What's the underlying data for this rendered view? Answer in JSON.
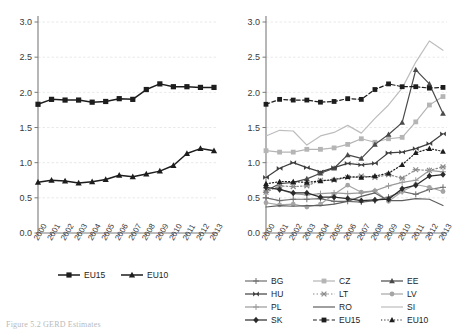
{
  "figure": {
    "caption": "Figure 5.2  GERD Estimates",
    "panels": [
      "left",
      "right"
    ]
  },
  "colors": {
    "dark": "#1d1d1d",
    "mid_dark": "#555555",
    "mid": "#7a7a7a",
    "light_mid": "#9e9e9e",
    "light": "#b5b5b5",
    "lighter": "#c8c8c8",
    "grid": "#e3e3e3",
    "axis": "#7b7b7b",
    "text": "#3a3a3a"
  },
  "chart_data": [
    {
      "panel": "left",
      "type": "line",
      "title": "",
      "xlabel": "",
      "ylabel": "",
      "grid": true,
      "legend_position": "bottom",
      "x": [
        "2000",
        "2001",
        "2002",
        "2003",
        "2004",
        "2005",
        "2006",
        "2007",
        "2008",
        "2009",
        "2010",
        "2011",
        "2012",
        "2013"
      ],
      "xlim": [
        2000,
        2013
      ],
      "ylim": [
        0.0,
        3.0
      ],
      "yticks": [
        "0.0",
        "0.5",
        "1.0",
        "1.5",
        "2.0",
        "2.5",
        "3.0"
      ],
      "series": [
        {
          "name": "EU15",
          "marker": "square",
          "dash": "solid",
          "color": "#1d1d1d",
          "values": [
            1.83,
            1.9,
            1.89,
            1.89,
            1.86,
            1.87,
            1.91,
            1.9,
            2.04,
            2.12,
            2.08,
            2.08,
            2.07,
            2.07
          ]
        },
        {
          "name": "EU10",
          "marker": "triangle",
          "dash": "solid",
          "color": "#1d1d1d",
          "values": [
            0.72,
            0.75,
            0.74,
            0.71,
            0.73,
            0.76,
            0.82,
            0.8,
            0.84,
            0.88,
            0.96,
            1.13,
            1.2,
            1.17
          ]
        }
      ]
    },
    {
      "panel": "right",
      "type": "line",
      "title": "",
      "xlabel": "",
      "ylabel": "",
      "grid": true,
      "legend_position": "bottom",
      "x": [
        "2000",
        "2001",
        "2002",
        "2003",
        "2004",
        "2005",
        "2006",
        "2007",
        "2008",
        "2009",
        "2010",
        "2011",
        "2012",
        "2013"
      ],
      "xlim": [
        2000,
        2013
      ],
      "ylim": [
        0.0,
        3.0
      ],
      "yticks": [
        "0.0",
        "0.5",
        "1.0",
        "1.5",
        "2.0",
        "2.5",
        "3.0"
      ],
      "series": [
        {
          "name": "BG",
          "marker": "plus",
          "dash": "solid",
          "color": "#6e6e6e",
          "values": [
            0.5,
            0.46,
            0.48,
            0.48,
            0.49,
            0.45,
            0.45,
            0.44,
            0.46,
            0.51,
            0.59,
            0.55,
            0.62,
            0.65
          ]
        },
        {
          "name": "CZ",
          "marker": "square",
          "dash": "solid",
          "color": "#b5b5b5",
          "values": [
            1.17,
            1.15,
            1.15,
            1.19,
            1.19,
            1.21,
            1.26,
            1.34,
            1.29,
            1.34,
            1.36,
            1.58,
            1.82,
            1.94
          ]
        },
        {
          "name": "EE",
          "marker": "triangle",
          "dash": "solid",
          "color": "#4a4a4a",
          "values": [
            0.6,
            0.7,
            0.72,
            0.77,
            0.85,
            0.92,
            1.11,
            1.06,
            1.26,
            1.4,
            1.57,
            2.32,
            2.12,
            1.7
          ]
        },
        {
          "name": "HU",
          "marker": "bowtie",
          "dash": "solid",
          "color": "#3f3f3f",
          "values": [
            0.79,
            0.92,
            1.0,
            0.93,
            0.87,
            0.93,
            0.99,
            0.97,
            0.99,
            1.14,
            1.15,
            1.2,
            1.27,
            1.41
          ]
        },
        {
          "name": "LT",
          "marker": "asterisk",
          "dash": "dot",
          "color": "#8a8a8a",
          "values": [
            0.58,
            0.67,
            0.66,
            0.67,
            0.75,
            0.75,
            0.79,
            0.81,
            0.79,
            0.83,
            0.78,
            0.9,
            0.89,
            0.94
          ]
        },
        {
          "name": "LV",
          "marker": "circle",
          "dash": "solid",
          "color": "#a5a5a5",
          "values": [
            0.43,
            0.4,
            0.41,
            0.37,
            0.41,
            0.55,
            0.68,
            0.58,
            0.6,
            0.45,
            0.59,
            0.69,
            0.65,
            0.59
          ]
        },
        {
          "name": "PL",
          "marker": "plus",
          "dash": "solid",
          "color": "#9a9a9a",
          "values": [
            0.64,
            0.62,
            0.56,
            0.54,
            0.56,
            0.57,
            0.56,
            0.57,
            0.6,
            0.67,
            0.72,
            0.75,
            0.89,
            0.87
          ]
        },
        {
          "name": "RO",
          "marker": "none",
          "dash": "solid",
          "color": "#5f5f5f",
          "values": [
            0.37,
            0.39,
            0.38,
            0.39,
            0.39,
            0.41,
            0.45,
            0.52,
            0.57,
            0.46,
            0.46,
            0.49,
            0.48,
            0.39
          ]
        },
        {
          "name": "SI",
          "marker": "none",
          "dash": "solid",
          "color": "#bdbdbd",
          "values": [
            1.38,
            1.46,
            1.45,
            1.25,
            1.38,
            1.43,
            1.53,
            1.42,
            1.63,
            1.82,
            2.06,
            2.43,
            2.73,
            2.6
          ]
        },
        {
          "name": "SK",
          "marker": "diamond",
          "dash": "solid",
          "color": "#2b2b2b",
          "values": [
            0.65,
            0.62,
            0.57,
            0.57,
            0.51,
            0.51,
            0.49,
            0.46,
            0.47,
            0.48,
            0.63,
            0.68,
            0.81,
            0.83
          ]
        },
        {
          "name": "EU15",
          "marker": "square",
          "dash": "dashed",
          "color": "#1d1d1d",
          "values": [
            1.83,
            1.9,
            1.89,
            1.89,
            1.86,
            1.87,
            1.91,
            1.9,
            2.04,
            2.12,
            2.08,
            2.08,
            2.06,
            2.07
          ]
        },
        {
          "name": "EU10",
          "marker": "triangle",
          "dash": "dotted",
          "color": "#1d1d1d",
          "values": [
            0.7,
            0.73,
            0.73,
            0.72,
            0.74,
            0.76,
            0.8,
            0.79,
            0.81,
            0.85,
            0.97,
            1.14,
            1.2,
            1.16
          ]
        }
      ]
    }
  ],
  "legends": {
    "left": {
      "entries": [
        {
          "label": "EU15",
          "marker": "square",
          "dash": "solid",
          "color": "#1d1d1d"
        },
        {
          "label": "EU10",
          "marker": "triangle",
          "dash": "solid",
          "color": "#1d1d1d"
        }
      ]
    },
    "right": {
      "entries": [
        {
          "label": "BG",
          "marker": "plus",
          "dash": "solid",
          "color": "#6e6e6e"
        },
        {
          "label": "CZ",
          "marker": "square",
          "dash": "solid",
          "color": "#b5b5b5"
        },
        {
          "label": "EE",
          "marker": "triangle",
          "dash": "solid",
          "color": "#4a4a4a"
        },
        {
          "label": "HU",
          "marker": "bowtie",
          "dash": "solid",
          "color": "#3f3f3f"
        },
        {
          "label": "LT",
          "marker": "asterisk",
          "dash": "dot",
          "color": "#8a8a8a"
        },
        {
          "label": "LV",
          "marker": "circle",
          "dash": "solid",
          "color": "#a5a5a5"
        },
        {
          "label": "PL",
          "marker": "plus",
          "dash": "solid",
          "color": "#9a9a9a"
        },
        {
          "label": "RO",
          "marker": "none",
          "dash": "solid",
          "color": "#5f5f5f"
        },
        {
          "label": "SI",
          "marker": "none",
          "dash": "solid",
          "color": "#bdbdbd"
        },
        {
          "label": "SK",
          "marker": "diamond",
          "dash": "solid",
          "color": "#2b2b2b"
        },
        {
          "label": "EU15",
          "marker": "square",
          "dash": "dashed",
          "color": "#1d1d1d"
        },
        {
          "label": "EU10",
          "marker": "triangle",
          "dash": "dotted",
          "color": "#1d1d1d"
        }
      ]
    }
  }
}
